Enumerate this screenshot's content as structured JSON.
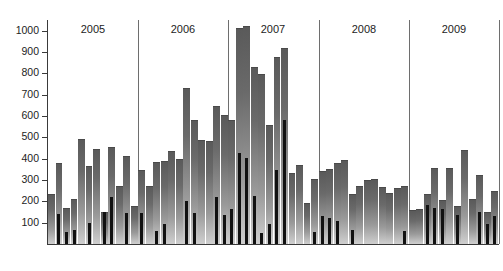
{
  "chart_data": {
    "type": "bar",
    "title": "",
    "subtitle": "",
    "xlabel": "",
    "ylabel": "",
    "ylim": [
      0,
      1050
    ],
    "grid": false,
    "legend_position": "none",
    "y_ticks": [
      100,
      200,
      300,
      400,
      500,
      600,
      700,
      800,
      900,
      1000
    ],
    "y_tick_labels": [
      "100",
      "200",
      "300",
      "400",
      "500",
      "600",
      "700",
      "800",
      "900",
      "1000"
    ],
    "group_labels": [
      "2005",
      "2006",
      "2007",
      "2008",
      "2009"
    ],
    "months_per_group": 12,
    "categories": [
      "2005-01",
      "2005-02",
      "2005-03",
      "2005-04",
      "2005-05",
      "2005-06",
      "2005-07",
      "2005-08",
      "2005-09",
      "2005-10",
      "2005-11",
      "2005-12",
      "2006-01",
      "2006-02",
      "2006-03",
      "2006-04",
      "2006-05",
      "2006-06",
      "2006-07",
      "2006-08",
      "2006-09",
      "2006-10",
      "2006-11",
      "2006-12",
      "2007-01",
      "2007-02",
      "2007-03",
      "2007-04",
      "2007-05",
      "2007-06",
      "2007-07",
      "2007-08",
      "2007-09",
      "2007-10",
      "2007-11",
      "2007-12",
      "2008-01",
      "2008-02",
      "2008-03",
      "2008-04",
      "2008-05",
      "2008-06",
      "2008-07",
      "2008-08",
      "2008-09",
      "2008-10",
      "2008-11",
      "2008-12",
      "2009-01",
      "2009-02",
      "2009-03",
      "2009-04",
      "2009-05",
      "2009-06",
      "2009-07",
      "2009-08",
      "2009-09",
      "2009-10",
      "2009-11",
      "2009-12"
    ],
    "series": [
      {
        "name": "total",
        "color": "#7a7a7a",
        "values": [
          235,
          378,
          170,
          210,
          492,
          365,
          447,
          150,
          455,
          272,
          413,
          180,
          345,
          270,
          383,
          390,
          437,
          400,
          733,
          580,
          487,
          483,
          648,
          605,
          583,
          1012,
          1020,
          832,
          795,
          557,
          878,
          920,
          333,
          372,
          192,
          305,
          340,
          352,
          382,
          396,
          236,
          272,
          298,
          307,
          268,
          238,
          262,
          272,
          158,
          162,
          235,
          358,
          205,
          358,
          180,
          443,
          210,
          325,
          152,
          250
        ]
      },
      {
        "name": "subset",
        "color": "#111111",
        "values": [
          0,
          140,
          55,
          65,
          0,
          100,
          0,
          148,
          220,
          0,
          145,
          0,
          146,
          0,
          62,
          95,
          0,
          0,
          203,
          147,
          0,
          0,
          220,
          135,
          165,
          427,
          405,
          223,
          50,
          95,
          345,
          580,
          0,
          0,
          0,
          57,
          130,
          122,
          110,
          0,
          65,
          0,
          0,
          0,
          0,
          0,
          0,
          60,
          0,
          0,
          185,
          170,
          162,
          0,
          135,
          0,
          0,
          152,
          95,
          132
        ]
      }
    ]
  },
  "axis": {
    "y_label_prefix": "",
    "baseline_label": ""
  },
  "footer": {
    "caption": ""
  }
}
